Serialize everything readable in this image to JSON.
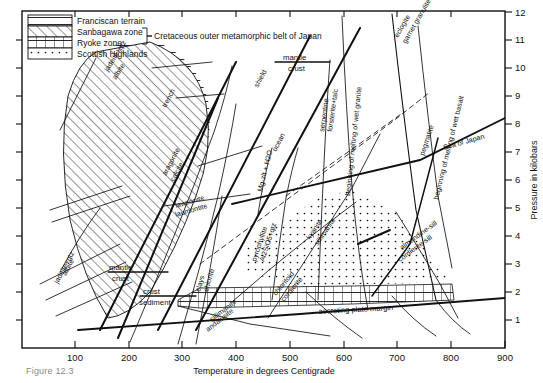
{
  "figure": {
    "caption": "Figure 12.3",
    "type": "pressure-temperature-phase-diagram"
  },
  "axes": {
    "x": {
      "label": "Temperature in degrees Centigrade",
      "min": 0,
      "max": 900,
      "ticks": [
        100,
        200,
        300,
        400,
        500,
        600,
        700,
        800,
        900
      ],
      "tick_labels": [
        "100",
        "200",
        "300",
        "400",
        "500",
        "600",
        "700",
        "800",
        "900"
      ],
      "unit": "degrees Centigrade"
    },
    "y": {
      "label": "Pressure in kilobars",
      "min": 0,
      "max": 12,
      "ticks": [
        1,
        2,
        3,
        4,
        5,
        6,
        7,
        8,
        9,
        10,
        11,
        12
      ],
      "tick_labels": [
        "1",
        "2",
        "3",
        "4",
        "5",
        "6",
        "7",
        "8",
        "9",
        "10",
        "11",
        "12"
      ],
      "unit": "kilobars",
      "label_side": "right"
    }
  },
  "legend": {
    "items": [
      {
        "label": "Franciscan terrain",
        "pattern": "horizontal-lines"
      },
      {
        "label": "Sanbagawa zone",
        "pattern": "diagonal-hatch"
      },
      {
        "label": "Ryoke zone",
        "pattern": "vertical-grid"
      },
      {
        "label": "Scottish Highlands",
        "pattern": "dots"
      }
    ],
    "bracket_note": "Cretaceous outer metamorphic belt of Japan",
    "bracket_covers": [
      "Sanbagawa zone",
      "Ryoke zone"
    ]
  },
  "regions": [
    {
      "name": "franciscan-terrain",
      "pattern": "horizontal-lines"
    },
    {
      "name": "sanbagawa-zone",
      "pattern": "diagonal-hatch"
    },
    {
      "name": "ryoke-zone",
      "pattern": "vertical-grid"
    },
    {
      "name": "scottish-highlands",
      "pattern": "dots"
    }
  ],
  "reaction_curves": [
    {
      "name": "jadeite-albite",
      "label_top": "jadeite+qtz",
      "label_bottom": "albite"
    },
    {
      "name": "aragonite-calcite",
      "label_top": "aragonite",
      "label_bottom": "calcite"
    },
    {
      "name": "lawsonite-laumontite",
      "label_top": "lawsonite",
      "label_bottom": "laumontite"
    },
    {
      "name": "albite-jadeite-qtz",
      "label_top": "albite",
      "label_bottom": "jadeite+qtz"
    },
    {
      "name": "clays-chlorite",
      "label_top": "clays",
      "label_bottom": "chlorite"
    },
    {
      "name": "pyrophyllite-al2sio5",
      "label_top": "pyrophyllite",
      "label_bottom": "Al2SiO5+qtz"
    },
    {
      "name": "kyanite-sillimanite",
      "label_top": "kyanite",
      "label_bottom": "sillimanite"
    },
    {
      "name": "chloritoid-cordierite",
      "label_top": "chloritoid",
      "label_bottom": "cordierite"
    },
    {
      "name": "sillimanite-andalusite",
      "label_top": "sillimanite",
      "label_bottom": "andalusite"
    },
    {
      "name": "almandine-cordierite",
      "label_top": "almandine-sill",
      "label_bottom": "cordierite-sill"
    },
    {
      "name": "serpentine-forsterite",
      "label_top": "serpentine",
      "label_bottom": "forsterite+talc"
    },
    {
      "name": "eclogite-garnet-granulite",
      "label_top": "eclogite",
      "label_bottom": "garnet granulite"
    },
    {
      "name": "mg-zeolite-h2o",
      "label_top": "Mg-zlt + H2O",
      "label_bottom": ""
    }
  ],
  "gradient_lines": [
    {
      "name": "trench",
      "label": "trench"
    },
    {
      "name": "shield",
      "label": "shield"
    },
    {
      "name": "ocean",
      "label": "ocean"
    },
    {
      "name": "sea-of-japan",
      "label": "Sea of Japan"
    },
    {
      "name": "accreting-plate-margin",
      "label": "accreting plate margin"
    },
    {
      "name": "pegmatite",
      "label": "pegmatite"
    }
  ],
  "boundary_labels": [
    {
      "name": "mantle-crust-left",
      "top": "mantle",
      "bottom": "crust"
    },
    {
      "name": "crust-sediment",
      "top": "crust",
      "bottom": "sediment"
    },
    {
      "name": "mantle-crust-upper",
      "top": "mantle",
      "bottom": "crust"
    }
  ],
  "melting_curves": [
    {
      "name": "beginning-of-melting-of-wet-granite",
      "label": "beginning of melting of wet granite"
    },
    {
      "name": "beginning-of-melting-of-wet-basalt",
      "label": "beginning of melting of wet basalt"
    }
  ]
}
